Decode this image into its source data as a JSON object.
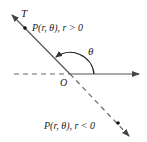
{
  "diagram": {
    "labels": {
      "terminal_side": "T",
      "origin": "O",
      "angle": "θ",
      "point_positive": "P(r, θ), r > 0",
      "point_negative": "P(r, θ), r < 0"
    },
    "colors": {
      "line": "#555555",
      "point": "#111111",
      "text": "#222222",
      "background": "#ffffff"
    },
    "geometry": {
      "origin": [
        70,
        74
      ],
      "polar_axis_end": [
        139,
        74
      ],
      "negative_axis_start": [
        14,
        74
      ],
      "terminal_ray_end": [
        12,
        15
      ],
      "extended_ray_end": [
        129,
        136
      ],
      "point_positive": [
        25,
        28
      ],
      "point_negative": [
        118,
        123
      ]
    }
  }
}
